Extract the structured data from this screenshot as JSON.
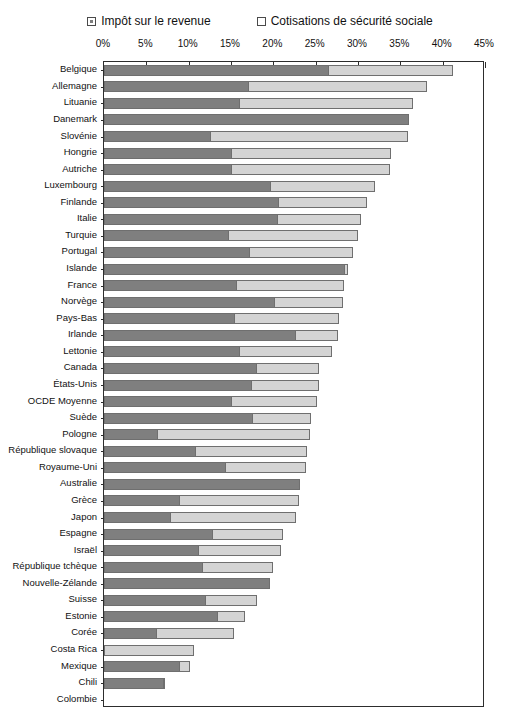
{
  "legend": {
    "position": "top-center",
    "items": [
      {
        "label": "Impôt sur le revenue",
        "swatch": "dark-gray-square-icon",
        "color": "#7f7f7f"
      },
      {
        "label": "Cotisations de sécurité sociale",
        "swatch": "light-gray-square-icon",
        "color": "#d4d4d4"
      }
    ]
  },
  "axis": {
    "tick_labels": [
      "0%",
      "5%",
      "10%",
      "15%",
      "20%",
      "25%",
      "30%",
      "35%",
      "40%",
      "45%"
    ],
    "min": 0,
    "max": 45
  },
  "chart_data": {
    "type": "bar",
    "orientation": "horizontal",
    "stacked": true,
    "title": "",
    "subtitle": "",
    "xlabel": "",
    "ylabel": "",
    "xlim": [
      0,
      45
    ],
    "xticks": [
      0,
      5,
      10,
      15,
      20,
      25,
      30,
      35,
      40,
      45
    ],
    "xtick_labels": [
      "0%",
      "5%",
      "10%",
      "15%",
      "20%",
      "25%",
      "30%",
      "35%",
      "40%",
      "45%"
    ],
    "grid": false,
    "legend_position": "top-center",
    "categories": [
      "Belgique",
      "Allemagne",
      "Lituanie",
      "Danemark",
      "Slovénie",
      "Hongrie",
      "Autriche",
      "Luxembourg",
      "Finlande",
      "Italie",
      "Turquie",
      "Portugal",
      "Islande",
      "France",
      "Norvège",
      "Pays-Bas",
      "Irlande",
      "Lettonie",
      "Canada",
      "États-Unis",
      "OCDE Moyenne",
      "Suède",
      "Pologne",
      "République slovaque",
      "Royaume-Uni",
      "Australie",
      "Grèce",
      "Japon",
      "Espagne",
      "Israël",
      "République tchèque",
      "Nouvelle-Zélande",
      "Suisse",
      "Estonie",
      "Corée",
      "Costa Rica",
      "Mexique",
      "Chili",
      "Colombie"
    ],
    "series": [
      {
        "name": "Impôt sur le revenue",
        "color": "#7f7f7f",
        "values": [
          26.5,
          17.0,
          15.9,
          36.0,
          12.5,
          15.0,
          15.0,
          19.6,
          20.5,
          20.4,
          14.6,
          17.1,
          28.4,
          15.6,
          20.1,
          15.4,
          22.6,
          15.9,
          18.0,
          17.4,
          15.0,
          17.5,
          6.3,
          10.8,
          14.3,
          23.2,
          8.9,
          7.8,
          12.8,
          11.1,
          11.6,
          19.6,
          11.9,
          13.4,
          6.2,
          0.0,
          8.8,
          7.0,
          0.0
        ]
      },
      {
        "name": "Cotisations de sécurité sociale",
        "color": "#d4d4d4",
        "values": [
          14.7,
          21.2,
          20.6,
          0.0,
          23.4,
          18.9,
          18.8,
          12.4,
          10.6,
          10.0,
          15.4,
          12.3,
          0.4,
          12.7,
          8.1,
          12.3,
          5.0,
          11.0,
          7.4,
          8.0,
          10.2,
          7.0,
          18.0,
          13.2,
          9.6,
          0.0,
          14.1,
          14.9,
          8.4,
          9.8,
          8.4,
          0.0,
          6.2,
          3.2,
          9.2,
          10.6,
          1.3,
          0.2,
          0.0
        ]
      }
    ],
    "totals": [
      41.2,
      38.2,
      36.5,
      36.0,
      35.9,
      33.9,
      33.8,
      32.0,
      31.1,
      30.4,
      30.0,
      29.4,
      28.8,
      28.3,
      28.2,
      27.7,
      27.6,
      26.9,
      25.4,
      25.4,
      25.2,
      24.5,
      24.3,
      24.0,
      23.9,
      23.2,
      23.0,
      22.7,
      21.2,
      20.9,
      20.0,
      19.6,
      18.1,
      16.6,
      15.4,
      10.6,
      10.1,
      7.2,
      0.0
    ]
  }
}
